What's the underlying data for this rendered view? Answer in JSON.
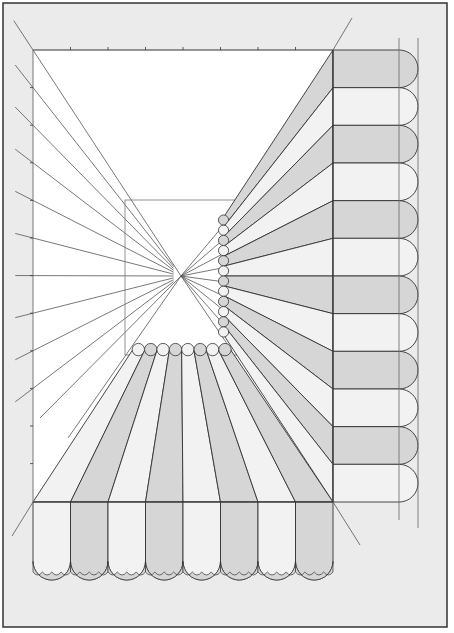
{
  "figure": {
    "title": "One-point perspective drawing of a striped awning",
    "colors": {
      "page_background": "#ebebeb",
      "frame_border": "#333333",
      "picture_plane": "#ffffff",
      "stripe_dark": "#d6d6d6",
      "stripe_light": "#f2f2f2",
      "line": "#333333",
      "guide_line": "#555555"
    },
    "vanishing_point": {
      "x": 181,
      "y": 276
    },
    "picture_plane": {
      "x": 33,
      "y": 50,
      "width": 300,
      "height": 452
    },
    "inner_rect": {
      "x": 125,
      "y": 200,
      "width": 112,
      "height": 155
    },
    "right_awning": {
      "stripe_count": 12,
      "x_start": 333,
      "x_end": 398,
      "y_start": 50,
      "y_end": 502
    },
    "bottom_awning": {
      "stripe_count": 8,
      "x_start": 33,
      "x_end": 333,
      "y_start": 502,
      "y_end": 570
    },
    "top_tick_count": 7,
    "left_tick_count": 11
  }
}
